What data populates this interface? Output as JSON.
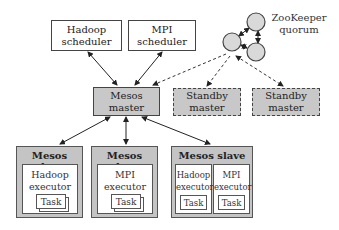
{
  "schedulers": [
    {
      "line1": "Hadoop",
      "line2": "scheduler"
    },
    {
      "line1": "MPI",
      "line2": "scheduler"
    }
  ],
  "master": {
    "line1": "Mesos",
    "line2": "master"
  },
  "standby": [
    {
      "line1": "Standby",
      "line2": "master"
    },
    {
      "line1": "Standby",
      "line2": "master"
    }
  ],
  "zookeeper": {
    "line1": "ZooKeeper",
    "line2": "quorum",
    "node_count": 3
  },
  "slaves": [
    {
      "title": "Mesos slave",
      "executors": [
        {
          "line1": "Hadoop",
          "line2": "executor",
          "task": "Task"
        }
      ]
    },
    {
      "title": "Mesos slave",
      "executors": [
        {
          "line1": "MPI",
          "line2": "executor",
          "task": "Task"
        }
      ]
    },
    {
      "title": "Mesos slave",
      "executors": [
        {
          "line1": "Hadoop",
          "line2": "executor",
          "task": "Task"
        },
        {
          "line1": "MPI",
          "line2": "executor",
          "task": "Task"
        }
      ]
    }
  ],
  "colors": {
    "node_fill": "#c8c8c8",
    "zk_fill": "#d9d9d9",
    "stroke": "#444444",
    "background": "#ffffff"
  }
}
